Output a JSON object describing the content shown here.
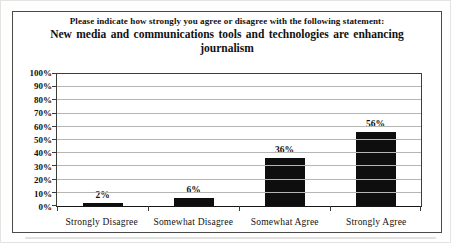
{
  "title": {
    "line1": "Please indicate how strongly you agree or disagree with the following statement:",
    "line2": "New media and communications tools and technologies are enhancing journalism"
  },
  "chart_data": {
    "type": "bar",
    "title": "Please indicate how strongly you agree or disagree with the following statement: New media and communications tools and technologies are enhancing journalism",
    "categories": [
      "Strongly Disagree",
      "Somewhat Disagree",
      "Somewhat Agree",
      "Strongly Agree"
    ],
    "values": [
      2,
      6,
      36,
      56
    ],
    "value_labels": [
      "2%",
      "6%",
      "36%",
      "56%"
    ],
    "xlabel": "",
    "ylabel": "",
    "ylim": [
      0,
      100
    ],
    "ytick_step": 10,
    "ytick_labels": [
      "0%",
      "10%",
      "20%",
      "30%",
      "40%",
      "50%",
      "60%",
      "70%",
      "80%",
      "90%",
      "100%"
    ],
    "grid": "horizontal",
    "legend": "none",
    "bar_color": "#0e0e0e",
    "grid_color": "#b5b5b2",
    "axis_color": "#3a3a38"
  }
}
